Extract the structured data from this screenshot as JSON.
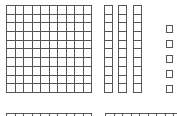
{
  "diagram": {
    "type": "base-ten-blocks",
    "blocks": {
      "hundreds_visible_full": 1,
      "hundreds_partial_bottom": 2,
      "tens": 3,
      "ones": 5
    },
    "colors": {
      "outline": "#555555",
      "fill": "#ffffff"
    }
  }
}
